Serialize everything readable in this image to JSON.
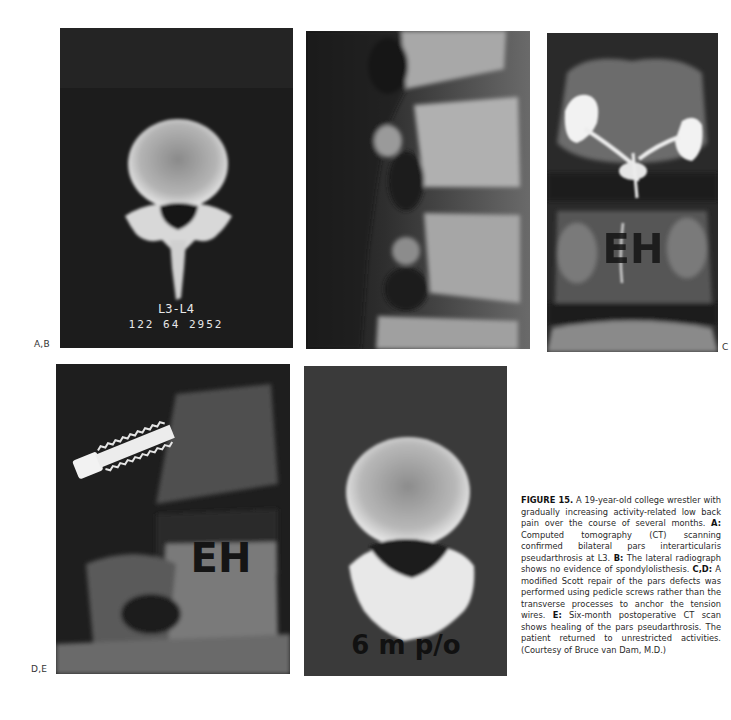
{
  "figure": {
    "panel_labels": {
      "ab": "A,B",
      "c": "C",
      "de": "D,E"
    },
    "panel_a": {
      "overlay_line1": "L3-L4",
      "overlay_line2": "122 64 2952"
    },
    "panel_c": {
      "overlay": "EH"
    },
    "panel_d": {
      "overlay": "EH"
    },
    "panel_e": {
      "overlay": "6 m p/o"
    },
    "caption": {
      "title": "FIGURE 15.",
      "intro": " A 19-year-old college wrestler with gradually increasing activity-related low back pain over the course of several months. ",
      "a_label": "A:",
      "a_text": " Computed tomography (CT) scanning confirmed bilateral pars interarticularis pseudarthrosis at L3. ",
      "b_label": "B:",
      "b_text": " The lateral radiograph shows no evidence of spondylolisthesis. ",
      "cd_label": "C,D:",
      "cd_text": " A modified Scott repair of the pars defects was performed using pedicle screws rather than the transverse processes to anchor the tension wires. ",
      "e_label": "E:",
      "e_text": " Six-month postoperative CT scan shows healing of the pars pseudarthrosis. The patient returned to unrestricted activities. (Courtesy of Bruce van Dam, M.D.)"
    }
  }
}
